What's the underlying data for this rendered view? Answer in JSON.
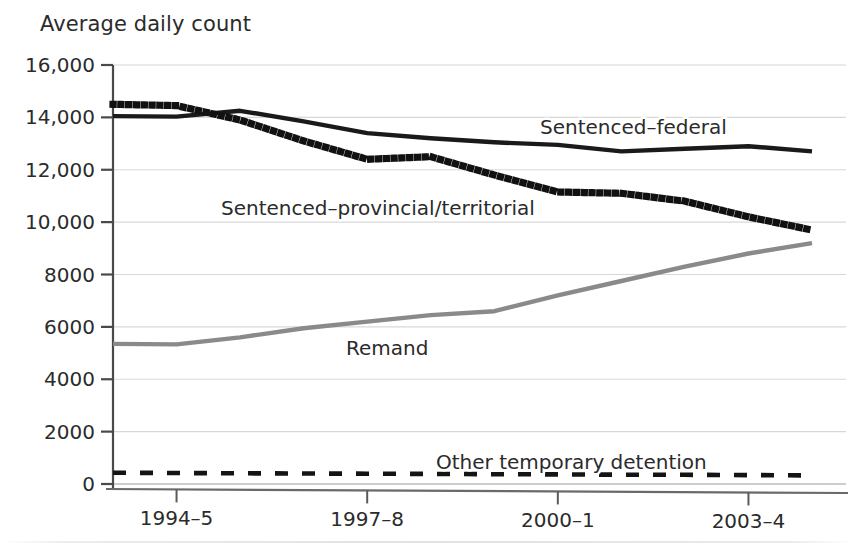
{
  "chart_data": {
    "type": "line",
    "title": "Average daily count",
    "xlabel": "",
    "ylabel": "Average daily count",
    "grid": true,
    "legend_position": "inline-labels",
    "x": [
      "1993-4",
      "1994-5",
      "1995-6",
      "1996-7",
      "1997-8",
      "1998-9",
      "1999-0",
      "2000-1",
      "2001-2",
      "2002-3",
      "2003-4",
      "2004-5"
    ],
    "xtick_labels": [
      "1994–5",
      "1997–8",
      "2000–1",
      "2003–4"
    ],
    "xtick_values": [
      "1994-5",
      "1997-8",
      "2000-1",
      "2003-4"
    ],
    "ytick_labels": [
      "0",
      "2000",
      "4000",
      "6000",
      "8000",
      "10,000",
      "12,000",
      "14,000",
      "16,000"
    ],
    "ytick_values": [
      0,
      2000,
      4000,
      6000,
      8000,
      10000,
      12000,
      14000,
      16000
    ],
    "ylim": [
      0,
      16000
    ],
    "series": [
      {
        "name": "Sentenced–federal",
        "label": "Sentenced–federal",
        "style": "solid",
        "color": "#1a1a1a",
        "values": [
          14050,
          14030,
          14250,
          13850,
          13400,
          13200,
          13050,
          12950,
          12700,
          12800,
          12900,
          12700
        ]
      },
      {
        "name": "Sentenced–provincial/territorial",
        "label": "Sentenced–provincial/territorial",
        "style": "dotted",
        "color": "#111111",
        "values": [
          14500,
          14450,
          13900,
          13100,
          12400,
          12500,
          11800,
          11150,
          11100,
          10800,
          10200,
          9700
        ]
      },
      {
        "name": "Remand",
        "label": "Remand",
        "style": "solid",
        "color": "#8a8a8a",
        "values": [
          5350,
          5330,
          5600,
          5950,
          6200,
          6450,
          6600,
          7200,
          7750,
          8300,
          8800,
          9200
        ]
      },
      {
        "name": "Other temporary detention",
        "label": "Other temporary detention",
        "style": "dashed",
        "color": "#141414",
        "values": [
          430,
          420,
          410,
          400,
          395,
          385,
          375,
          365,
          355,
          350,
          340,
          330
        ]
      }
    ],
    "annotations": [
      {
        "text": "Sentenced–federal",
        "x_px": 540,
        "y_px": 134
      },
      {
        "text": "Sentenced–provincial/territorial",
        "x_px": 221,
        "y_px": 215
      },
      {
        "text": "Remand",
        "x_px": 346,
        "y_px": 355
      },
      {
        "text": "Other temporary detention",
        "x_px": 436,
        "y_px": 469
      }
    ]
  },
  "axis": {
    "title": "Average daily count"
  }
}
